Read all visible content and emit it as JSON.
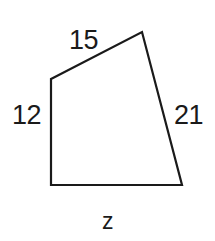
{
  "figure": {
    "name": "quadrilateral-side-lengths",
    "background_color": "#ffffff",
    "stroke_color": "#1a1a1a",
    "stroke_width": 2,
    "shape": {
      "type": "quadrilateral",
      "vertices": [
        {
          "name": "top-left",
          "x": 51,
          "y": 79
        },
        {
          "name": "top-right-apex",
          "x": 142,
          "y": 32
        },
        {
          "name": "bottom-right",
          "x": 182,
          "y": 185
        },
        {
          "name": "bottom-left",
          "x": 51,
          "y": 185
        }
      ]
    },
    "labels": {
      "top": "15",
      "left": "12",
      "right": "21",
      "bottom": "z"
    }
  }
}
